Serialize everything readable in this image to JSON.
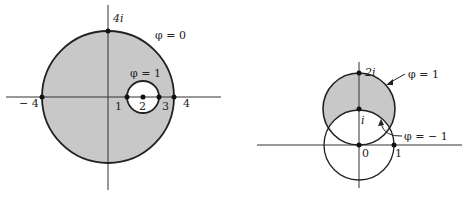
{
  "figure_left": {
    "labels": {
      "top_imag": "4i",
      "outer_curve": "φ = 0",
      "inner_curve": "φ = 1",
      "neg_four": "− 4",
      "one": "1",
      "two": "2",
      "three": "3",
      "four": "4"
    },
    "colors": {
      "shade": "#c8c8c8",
      "stroke": "#222222",
      "axis": "#333333"
    }
  },
  "figure_right": {
    "labels": {
      "top_imag": "2i",
      "upper_curve": "φ = 1",
      "mid_imag": "i",
      "lower_curve": "φ = − 1",
      "origin": "0",
      "one": "1"
    },
    "colors": {
      "shade": "#c8c8c8",
      "stroke": "#222222",
      "axis": "#333333"
    }
  }
}
